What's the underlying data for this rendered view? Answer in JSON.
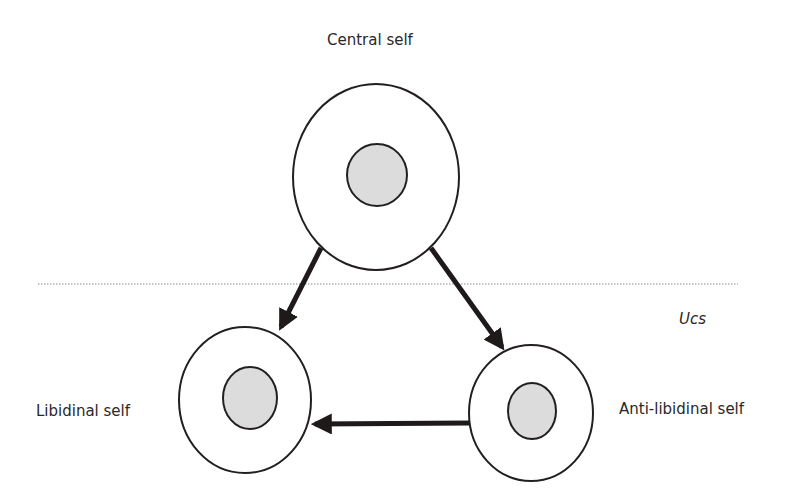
{
  "diagram": {
    "type": "structural-model",
    "boundary": {
      "label": "Ucs",
      "style": "dotted-line"
    },
    "nodes": [
      {
        "id": "central",
        "label": "Central self"
      },
      {
        "id": "libidinal",
        "label": "Libidinal self"
      },
      {
        "id": "anti_libidinal",
        "label": "Anti-libidinal self"
      }
    ],
    "edges": [
      {
        "from": "central",
        "to": "libidinal"
      },
      {
        "from": "central",
        "to": "anti_libidinal"
      },
      {
        "from": "anti_libidinal",
        "to": "libidinal"
      }
    ],
    "colors": {
      "stroke": "#231f1f",
      "arrow": "#1e1a1a",
      "nucleus_fill": "#dcdcdc",
      "divider": "#8a8a8a"
    }
  }
}
